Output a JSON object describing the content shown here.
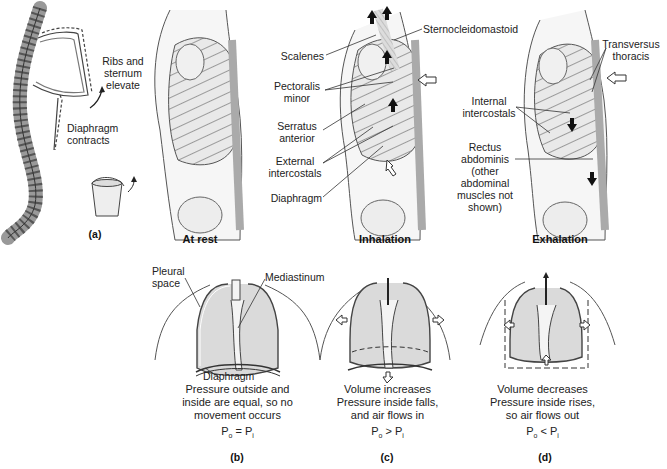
{
  "panel_a": {
    "labels": [
      "Ribs and sternum elevate",
      "Diaphragm contracts"
    ],
    "ribs_label_lines": [
      "Ribs and",
      "sternum",
      "elevate"
    ],
    "diaphragm_label_lines": [
      "Diaphragm",
      "contracts"
    ],
    "panel_letter": "(a)"
  },
  "torsos": {
    "at_rest": {
      "title": "At rest"
    },
    "inhalation": {
      "title": "Inhalation",
      "labels": {
        "sternocleidomastoid": "Sternocleidomastoid",
        "scalenes": "Scalenes",
        "pectoralis_minor_1": "Pectoralis",
        "pectoralis_minor_2": "minor",
        "serratus_1": "Serratus",
        "serratus_2": "anterior",
        "external_1": "External",
        "external_2": "intercostals",
        "diaphragm": "Diaphragm"
      }
    },
    "exhalation": {
      "title": "Exhalation",
      "labels": {
        "transversus_1": "Transversus",
        "transversus_2": "thoracis",
        "internal_1": "Internal",
        "internal_2": "intercostals",
        "rectus_1": "Rectus",
        "rectus_2": "abdominis",
        "rectus_3": "(other",
        "rectus_4": "abdominal",
        "rectus_5": "muscles not",
        "rectus_6": "shown)"
      }
    }
  },
  "lungs": {
    "b": {
      "labels": {
        "pleural_1": "Pleural",
        "pleural_2": "space",
        "mediastinum": "Mediastinum",
        "diaphragm": "Diaphragm"
      },
      "caption_lines": [
        "Pressure outside and",
        "inside are equal, so no",
        "movement occurs"
      ],
      "equation": {
        "left": "P",
        "left_sub": "o",
        "op": "=",
        "right": "P",
        "right_sub": "i"
      },
      "panel_letter": "(b)"
    },
    "c": {
      "caption_lines": [
        "Volume increases",
        "Pressure inside falls,",
        "and air flows in"
      ],
      "equation": {
        "left": "P",
        "left_sub": "o",
        "op": ">",
        "right": "P",
        "right_sub": "i"
      },
      "panel_letter": "(c)"
    },
    "d": {
      "caption_lines": [
        "Volume decreases",
        "Pressure inside rises,",
        "so air flows out"
      ],
      "equation": {
        "left": "P",
        "left_sub": "o",
        "op": "<",
        "right": "P",
        "right_sub": "i"
      },
      "panel_letter": "(d)"
    }
  },
  "colors": {
    "line": "#333333",
    "bone_fill": "#e6e6e6",
    "lung_fill": "#d9d9d9",
    "muscle": "#bdbdbd",
    "arrow_black": "#111111"
  }
}
